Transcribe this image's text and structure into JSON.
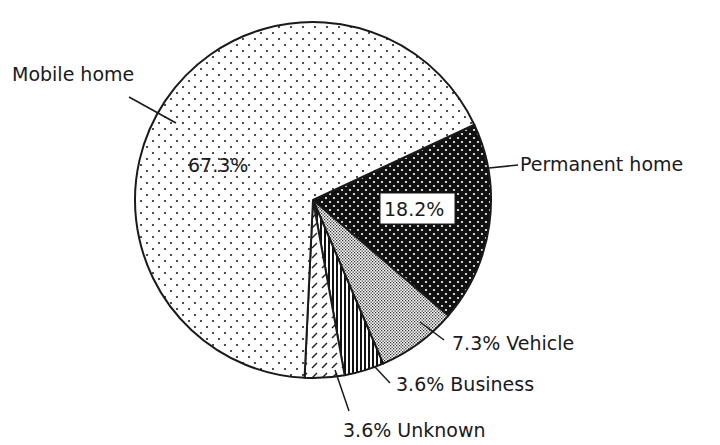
{
  "chart_data": {
    "type": "pie",
    "title": "",
    "categories": [
      "Mobile home",
      "Permanent home",
      "Vehicle",
      "Business",
      "Unknown"
    ],
    "values": [
      67.3,
      18.2,
      7.3,
      3.6,
      3.6
    ],
    "unit": "%",
    "start_angle_deg": 65,
    "direction": "clockwise",
    "slices": [
      {
        "name": "Permanent home",
        "value": 18.2,
        "label": "18.2%",
        "pattern": "black-with-white-dots",
        "label_position": "inside-boxed",
        "callout": "Permanent home"
      },
      {
        "name": "Vehicle",
        "value": 7.3,
        "label": "7.3% Vehicle",
        "pattern": "fine-gray-dots",
        "label_position": "outside"
      },
      {
        "name": "Business",
        "value": 3.6,
        "label": "3.6% Business",
        "pattern": "vertical-lines",
        "label_position": "outside"
      },
      {
        "name": "Unknown",
        "value": 3.6,
        "label": "3.6% Unknown",
        "pattern": "diagonal-hatch",
        "label_position": "outside"
      },
      {
        "name": "Mobile home",
        "value": 67.3,
        "label": "67.3%",
        "pattern": "sparse-black-dots",
        "label_position": "inside",
        "callout": "Mobile home"
      }
    ],
    "legend": "none"
  },
  "labels": {
    "mobile_home": "Mobile home",
    "mobile_pct": "67.3%",
    "permanent_home": "Permanent home",
    "permanent_pct": "18.2%",
    "vehicle": "7.3% Vehicle",
    "business": "3.6% Business",
    "unknown": "3.6% Unknown"
  },
  "colors": {
    "ink": "#1a1a1a",
    "background": "#ffffff"
  }
}
